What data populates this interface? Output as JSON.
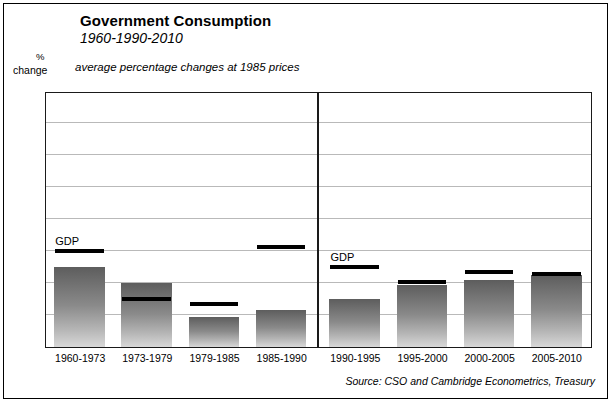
{
  "title": "Government Consumption",
  "subtitle": "1960-1990-2010",
  "axis_note": "average percentage changes at 1985 prices",
  "ylabel_line1": "%",
  "ylabel_line2": "change",
  "gdp_label": "GDP",
  "source": "Source: CSO and Cambridge Econometrics, Treasury",
  "colors": {
    "bar_top": "#5d5d5d",
    "bar_bottom": "#d8d8d8",
    "marker": "#000000",
    "grid": "#b9b9b9",
    "frame": "#1a1a1a"
  },
  "chart_data": {
    "type": "bar",
    "title": "Government Consumption",
    "subtitle": "1960-1990-2010",
    "xlabel": "",
    "ylabel": "% change",
    "ylim": [
      0,
      7.9
    ],
    "yticks": [
      0,
      1,
      2,
      3,
      4,
      5,
      6,
      7
    ],
    "ytick_labels": [
      "0",
      "1",
      "2",
      "3",
      "4",
      "5",
      "6",
      "7"
    ],
    "grid": true,
    "legend": "none",
    "annotations": [
      "average percentage changes at 1985 prices",
      "GDP",
      "GDP"
    ],
    "divider_after_category": "1985-1990",
    "categories": [
      "1960-1973",
      "1973-1979",
      "1979-1985",
      "1985-1990",
      "1990-1995",
      "1995-2000",
      "2000-2005",
      "2005-2010"
    ],
    "series": [
      {
        "name": "Government Consumption",
        "type": "bar",
        "values": [
          2.5,
          2.0,
          0.95,
          1.15,
          1.5,
          1.95,
          2.1,
          2.25
        ]
      },
      {
        "name": "GDP",
        "type": "marker",
        "values": [
          2.95,
          1.45,
          1.3,
          3.1,
          2.45,
          2.0,
          2.3,
          2.25
        ]
      }
    ]
  }
}
